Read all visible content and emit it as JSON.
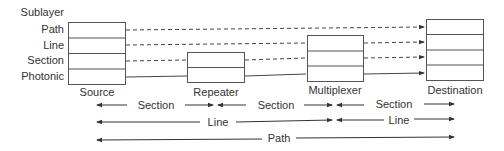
{
  "sublayer_header": "Sublayer",
  "sublayers": [
    "Path",
    "Line",
    "Section",
    "Photonic"
  ],
  "nodes": [
    {
      "id": "source",
      "label": "Source",
      "layers": 4
    },
    {
      "id": "repeater",
      "label": "Repeater",
      "layers": 2
    },
    {
      "id": "multiplexer",
      "label": "Multiplexer",
      "layers": 3
    },
    {
      "id": "destination",
      "label": "Destination",
      "layers": 4
    }
  ],
  "spans": {
    "section": [
      "Section",
      "Section",
      "Section"
    ],
    "line": [
      "Line",
      "Line"
    ],
    "path": "Path"
  },
  "colors": {
    "line": "#444444",
    "box": "#555555",
    "text": "#333333"
  }
}
